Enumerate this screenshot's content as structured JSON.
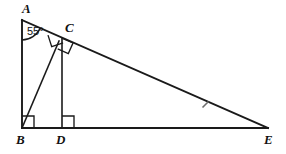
{
  "figure": {
    "type": "geometry-diagram",
    "stroke_color": "#1a1a1a",
    "tick_color": "#6e6e6e",
    "background": "#ffffff",
    "width": 286,
    "height": 154
  },
  "vertices": [
    {
      "id": "A",
      "label": "A",
      "x": 22,
      "y": 20,
      "label_x": 22,
      "label_y": 3
    },
    {
      "id": "B",
      "label": "B",
      "x": 22,
      "y": 128,
      "label_x": 18,
      "label_y": 133
    },
    {
      "id": "C",
      "label": "C",
      "x": 60,
      "y": 40,
      "label_x": 63,
      "label_y": 22
    },
    {
      "id": "D",
      "label": "D",
      "x": 62,
      "y": 128,
      "label_x": 58,
      "label_y": 133
    },
    {
      "id": "E",
      "label": "E",
      "x": 268,
      "y": 128,
      "label_x": 266,
      "label_y": 133
    }
  ],
  "segments": [
    {
      "id": "AB",
      "from": "A",
      "to": "B",
      "style": "main"
    },
    {
      "id": "AE",
      "from": "A",
      "to": "E",
      "style": "main"
    },
    {
      "id": "BE",
      "from": "B",
      "to": "E",
      "style": "main"
    },
    {
      "id": "BC",
      "from": "B",
      "to": "C",
      "style": "thin"
    },
    {
      "id": "DC",
      "from": "D",
      "to": "C",
      "style": "thin"
    }
  ],
  "angles": [
    {
      "id": "angle-A",
      "at": "A",
      "value": "55",
      "unit": "°",
      "label": "55°",
      "label_x": 27,
      "label_y": 26,
      "marker": "arc"
    },
    {
      "id": "right-angle-B",
      "at": "B",
      "label": "",
      "marker": "square"
    },
    {
      "id": "right-angle-D",
      "at": "D",
      "label": "",
      "marker": "square"
    },
    {
      "id": "right-angle-C-ae",
      "at": "C",
      "label": "",
      "marker": "square"
    },
    {
      "id": "right-angle-C-dc",
      "at": "C",
      "label": "",
      "marker": "square"
    }
  ],
  "tick_marks": [
    {
      "id": "tick-CE",
      "on": "AE",
      "x": 205,
      "y": 105
    }
  ]
}
